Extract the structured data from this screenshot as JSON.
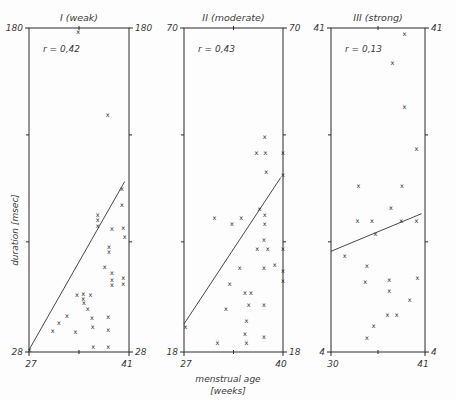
{
  "figure": {
    "background_color": "#fdfdfd",
    "ink_color": "#2b2b2b",
    "marker_glyph": "x",
    "axis_labels": {
      "y_title": "duration  [msec]",
      "x_title_line1": "menstrual age",
      "x_title_line2": "[weeks]"
    }
  },
  "chart_data": [
    {
      "type": "scatter",
      "title": "I (weak)",
      "annotation": "r = 0,42",
      "correlation": 0.42,
      "xlabel": "menstrual age [weeks]",
      "ylabel": "duration [msec]",
      "xlim": [
        27,
        41
      ],
      "ylim": [
        28,
        180
      ],
      "xticks": [
        27,
        41
      ],
      "yticks": [
        28,
        180
      ],
      "xtick_labels": [
        "27",
        "41"
      ],
      "ytick_labels_left": [
        "180",
        "28"
      ],
      "ytick_labels_right": [
        "180",
        "28"
      ],
      "grid": false,
      "legend": "none",
      "regression_line": {
        "x1": 27.0,
        "y1": 29.0,
        "x2": 40.4,
        "y2": 108.0
      },
      "points": [
        {
          "x": 33.9,
          "y": 178.0
        },
        {
          "x": 38.0,
          "y": 139.5
        },
        {
          "x": 40.0,
          "y": 104.5
        },
        {
          "x": 40.0,
          "y": 97.0
        },
        {
          "x": 36.6,
          "y": 92.5
        },
        {
          "x": 36.6,
          "y": 90.0
        },
        {
          "x": 36.6,
          "y": 87.0
        },
        {
          "x": 38.6,
          "y": 86.0
        },
        {
          "x": 40.2,
          "y": 86.5
        },
        {
          "x": 40.4,
          "y": 82.0
        },
        {
          "x": 38.2,
          "y": 77.5
        },
        {
          "x": 38.2,
          "y": 75.0
        },
        {
          "x": 37.6,
          "y": 68.0
        },
        {
          "x": 38.6,
          "y": 65.0
        },
        {
          "x": 38.6,
          "y": 62.0
        },
        {
          "x": 38.6,
          "y": 59.5
        },
        {
          "x": 40.2,
          "y": 63.0
        },
        {
          "x": 40.2,
          "y": 60.0
        },
        {
          "x": 33.7,
          "y": 55.0
        },
        {
          "x": 34.6,
          "y": 55.5
        },
        {
          "x": 34.6,
          "y": 53.0
        },
        {
          "x": 35.6,
          "y": 55.0
        },
        {
          "x": 34.7,
          "y": 51.0
        },
        {
          "x": 35.2,
          "y": 48.5
        },
        {
          "x": 32.3,
          "y": 45.0
        },
        {
          "x": 35.8,
          "y": 44.0
        },
        {
          "x": 38.1,
          "y": 44.5
        },
        {
          "x": 31.2,
          "y": 41.5
        },
        {
          "x": 35.9,
          "y": 40.0
        },
        {
          "x": 30.3,
          "y": 38.0
        },
        {
          "x": 33.5,
          "y": 37.5
        },
        {
          "x": 38.1,
          "y": 38.5
        },
        {
          "x": 36.0,
          "y": 30.5
        },
        {
          "x": 38.1,
          "y": 30.5
        },
        {
          "x": 27.1,
          "y": 29.0
        }
      ]
    },
    {
      "type": "scatter",
      "title": "II (moderate)",
      "annotation": "r = 0,43",
      "correlation": 0.43,
      "xlabel": "menstrual age [weeks]",
      "ylabel": "duration [msec]",
      "xlim": [
        27,
        40
      ],
      "ylim": [
        18,
        70
      ],
      "xticks": [
        27,
        40
      ],
      "yticks": [
        18,
        70
      ],
      "xtick_labels": [
        "27",
        "40"
      ],
      "ytick_labels_left": [
        "70",
        "18"
      ],
      "ytick_labels_right": [
        "70",
        "18"
      ],
      "grid": false,
      "legend": "none",
      "regression_line": {
        "x1": 27.0,
        "y1": 22.5,
        "x2": 39.7,
        "y2": 46.0
      },
      "points": [
        {
          "x": 37.6,
          "y": 52.5
        },
        {
          "x": 36.5,
          "y": 50.0
        },
        {
          "x": 37.7,
          "y": 50.0
        },
        {
          "x": 40.0,
          "y": 50.0
        },
        {
          "x": 37.8,
          "y": 47.0
        },
        {
          "x": 40.0,
          "y": 46.5
        },
        {
          "x": 36.9,
          "y": 41.0
        },
        {
          "x": 37.6,
          "y": 40.0
        },
        {
          "x": 31.0,
          "y": 39.5
        },
        {
          "x": 34.5,
          "y": 39.5
        },
        {
          "x": 37.6,
          "y": 38.5
        },
        {
          "x": 33.3,
          "y": 38.5
        },
        {
          "x": 37.5,
          "y": 36.0
        },
        {
          "x": 36.6,
          "y": 34.5
        },
        {
          "x": 38.0,
          "y": 34.5
        },
        {
          "x": 40.0,
          "y": 34.5
        },
        {
          "x": 38.9,
          "y": 32.0
        },
        {
          "x": 40.0,
          "y": 31.0
        },
        {
          "x": 40.0,
          "y": 29.5
        },
        {
          "x": 34.3,
          "y": 31.5
        },
        {
          "x": 37.5,
          "y": 31.5
        },
        {
          "x": 33.0,
          "y": 29.0
        },
        {
          "x": 35.0,
          "y": 27.5
        },
        {
          "x": 35.8,
          "y": 27.5
        },
        {
          "x": 35.5,
          "y": 25.5
        },
        {
          "x": 37.5,
          "y": 25.5
        },
        {
          "x": 32.5,
          "y": 25.0
        },
        {
          "x": 35.2,
          "y": 23.0
        },
        {
          "x": 35.0,
          "y": 21.0
        },
        {
          "x": 27.2,
          "y": 22.0
        },
        {
          "x": 31.4,
          "y": 19.5
        },
        {
          "x": 35.2,
          "y": 19.5
        },
        {
          "x": 37.5,
          "y": 20.5
        }
      ]
    },
    {
      "type": "scatter",
      "title": "III (strong)",
      "annotation": "r = 0,13",
      "correlation": 0.13,
      "xlabel": "menstrual age [weeks]",
      "ylabel": "duration [msec]",
      "xlim": [
        30,
        41
      ],
      "ylim": [
        4,
        41
      ],
      "xticks": [
        30,
        41
      ],
      "yticks": [
        4,
        41
      ],
      "xtick_labels": [
        "30",
        "41"
      ],
      "ytick_labels_left": [
        "41",
        "4"
      ],
      "ytick_labels_right": [
        "41",
        "4"
      ],
      "grid": false,
      "legend": "none",
      "regression_line": {
        "x1": 30.0,
        "y1": 15.5,
        "x2": 40.6,
        "y2": 19.8
      },
      "points": [
        {
          "x": 38.6,
          "y": 40.3
        },
        {
          "x": 37.2,
          "y": 37.0
        },
        {
          "x": 38.6,
          "y": 32.0
        },
        {
          "x": 40.0,
          "y": 27.2
        },
        {
          "x": 33.2,
          "y": 23.0
        },
        {
          "x": 38.3,
          "y": 23.0
        },
        {
          "x": 37.0,
          "y": 20.5
        },
        {
          "x": 33.1,
          "y": 19.0
        },
        {
          "x": 34.8,
          "y": 19.0
        },
        {
          "x": 38.2,
          "y": 19.0
        },
        {
          "x": 40.0,
          "y": 19.0
        },
        {
          "x": 35.2,
          "y": 17.5
        },
        {
          "x": 31.6,
          "y": 15.0
        },
        {
          "x": 34.2,
          "y": 13.8
        },
        {
          "x": 40.1,
          "y": 12.5
        },
        {
          "x": 34.0,
          "y": 12.0
        },
        {
          "x": 36.8,
          "y": 12.2
        },
        {
          "x": 36.8,
          "y": 11.0
        },
        {
          "x": 39.2,
          "y": 10.0
        },
        {
          "x": 36.6,
          "y": 8.3
        },
        {
          "x": 37.7,
          "y": 8.3
        },
        {
          "x": 35.0,
          "y": 7.0
        },
        {
          "x": 34.2,
          "y": 5.6
        }
      ]
    }
  ]
}
